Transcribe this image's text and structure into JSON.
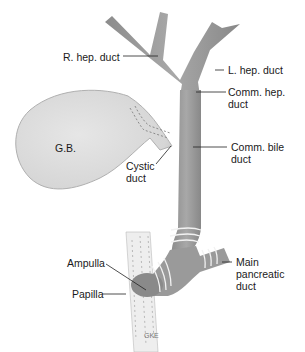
{
  "diagram": {
    "labels": {
      "r_hep_duct": "R. hep. duct",
      "l_hep_duct": "L. hep. duct",
      "comm_hep_duct_1": "Comm. hep.",
      "comm_hep_duct_2": "duct",
      "gb": "G.B.",
      "comm_bile_duct_1": "Comm. bile",
      "comm_bile_duct_2": "duct",
      "cystic_duct_1": "Cystic",
      "cystic_duct_2": "duct",
      "ampulla": "Ampulla",
      "papilla": "Papilla",
      "main_pancreatic_1": "Main",
      "main_pancreatic_2": "pancreatic",
      "main_pancreatic_3": "duct",
      "signature": "GKE"
    },
    "colors": {
      "duct": "#9a9a9a",
      "duct_dark": "#7a7a7a",
      "gallbladder": "#dcdcdc",
      "wall": "#e6e6e6",
      "leader": "#222222"
    }
  }
}
